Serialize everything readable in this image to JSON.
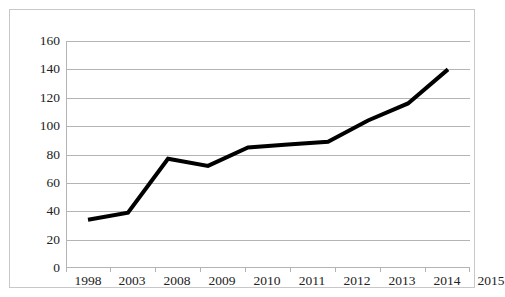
{
  "chart_data": {
    "type": "line",
    "title": "",
    "subtitle": "",
    "xlabel": "",
    "ylabel": "",
    "categories": [
      "1998",
      "2003",
      "2008",
      "2009",
      "2010",
      "2011",
      "2012",
      "2013",
      "2014",
      "2015"
    ],
    "series": [
      {
        "name": "Series 1",
        "values": [
          34,
          39,
          77,
          72,
          85,
          87,
          89,
          104,
          116,
          140
        ],
        "color": "#000000",
        "line_width": 4,
        "markers": false
      }
    ],
    "ylim": [
      0,
      160
    ],
    "ytick_values": [
      0,
      20,
      40,
      60,
      80,
      100,
      120,
      140,
      160
    ],
    "ytick_labels": [
      "0",
      "20",
      "40",
      "60",
      "80",
      "100",
      "120",
      "140",
      "160"
    ],
    "xtick_labels": [
      "1998",
      "2003",
      "2008",
      "2009",
      "2010",
      "2011",
      "2012",
      "2013",
      "2014",
      "2015"
    ],
    "grid": {
      "horizontal": true,
      "vertical": false,
      "color": "#b4b4b4"
    },
    "legend": {
      "visible": false,
      "position": "none"
    },
    "annotations": [],
    "plot_background": "#ffffff",
    "border_color": "#c8c8c8"
  }
}
